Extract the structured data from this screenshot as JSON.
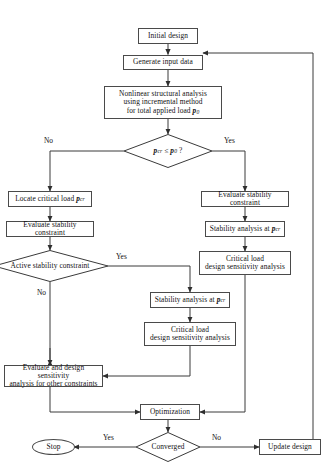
{
  "diagram": {
    "type": "flowchart",
    "nodes": {
      "initial_design": "Initial design",
      "generate_input": "Generate input data",
      "nonlinear_analysis_l1": "Nonlinear structural analysis",
      "nonlinear_analysis_l2": "using incremental method",
      "nonlinear_analysis_l3_pre": "for total applied load",
      "nonlinear_analysis_l3_var": "p",
      "nonlinear_analysis_l3_sub": "0",
      "decision_pcr_lhs": "p",
      "decision_pcr_lhs_sub": "cr",
      "decision_pcr_op": "≤",
      "decision_pcr_rhs": "p",
      "decision_pcr_rhs_sub": "0",
      "decision_pcr_q": "?",
      "locate_critical_load": "Locate critical load",
      "locate_critical_load_var": "p",
      "locate_critical_load_sub": "cr",
      "evaluate_stability_left": "Evaluate stability constraint",
      "active_stability": "Active stability constraint",
      "evaluate_stability_right": "Evaluate stability constraint",
      "stability_analysis_right": "Stability analysis at",
      "stability_analysis_right_var": "p",
      "stability_analysis_right_sub": "cr",
      "critical_load_dsa_right_l1": "Critical load",
      "critical_load_dsa_right_l2": "design sensitivity analysis",
      "stability_analysis_mid": "Stability analysis at",
      "stability_analysis_mid_var": "p",
      "stability_analysis_mid_sub": "cr",
      "critical_load_dsa_mid_l1": "Critical load",
      "critical_load_dsa_mid_l2": "design sensitivity analysis",
      "evaluate_other_l1": "Evaluate and design sensitivity",
      "evaluate_other_l2": "analysis for other constraints",
      "optimization": "Optimization",
      "converged": "Converged",
      "stop": "Stop",
      "update_design": "Update design"
    },
    "edge_labels": {
      "pcr_no": "No",
      "pcr_yes": "Yes",
      "active_yes": "Yes",
      "active_no": "No",
      "converged_yes": "Yes",
      "converged_no": "No"
    },
    "colors": {
      "stroke": "#4a4a4a",
      "line": "#3a3a3a",
      "text": "#111111",
      "background": "#ffffff"
    }
  }
}
